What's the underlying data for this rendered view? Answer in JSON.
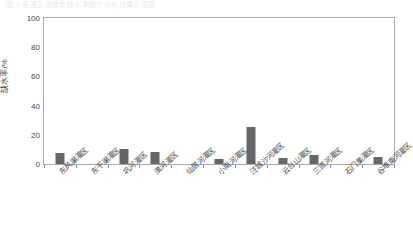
{
  "figure": {
    "top_caption": "图 3  各灌区现状年缺水率统计分析结果示意图"
  },
  "chart_data": {
    "type": "bar",
    "title": "",
    "xlabel": "",
    "ylabel": "缺水率/%",
    "ylim": [
      0,
      100
    ],
    "yticks": [
      0,
      20,
      40,
      60,
      80,
      100
    ],
    "ytick_labels": [
      "0",
      "20",
      "40",
      "60",
      "80",
      "100"
    ],
    "grid": false,
    "legend": "none",
    "bar_color": "#666668",
    "axis_color": "#a8a8ad",
    "categories": [
      "东风渠灌区",
      "东干渠灌区",
      "巩河灌区",
      "潢河灌区",
      "仙居河灌区",
      "小南河灌区",
      "汪城沙河灌区",
      "云台山灌区",
      "三道河灌区",
      "石门集灌区",
      "谷堆南河灌区"
    ],
    "values": [
      7.6,
      0.0,
      10.3,
      8.3,
      0.0,
      3.4,
      25.4,
      3.8,
      6.5,
      0.0,
      4.6
    ]
  }
}
